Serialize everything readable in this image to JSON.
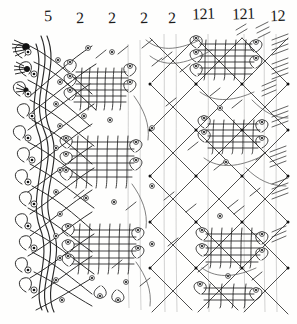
{
  "document": {
    "kind": "hand-drawn-diagram",
    "title": "Bobbin lace working diagram",
    "background_color": "#fefefd",
    "ink_color": "#1f1f1f",
    "faint_ink_color": "#9a9a9a",
    "width": 297,
    "height": 324
  },
  "header": {
    "label": "thread-count-row",
    "sequence": "5 2 2 2 2 121 121 12",
    "marks": [
      {
        "text": "5",
        "x": 44,
        "y": 8,
        "group": 1
      },
      {
        "text": "2",
        "x": 76,
        "y": 10,
        "group": 2
      },
      {
        "text": "2",
        "x": 108,
        "y": 10,
        "group": 3
      },
      {
        "text": "2",
        "x": 140,
        "y": 10,
        "group": 4
      },
      {
        "text": "2",
        "x": 168,
        "y": 10,
        "group": 5
      },
      {
        "text": "121",
        "x": 192,
        "y": 6,
        "group": 6
      },
      {
        "text": "121",
        "x": 232,
        "y": 6,
        "group": 7
      },
      {
        "text": "12",
        "x": 272,
        "y": 8,
        "group": 8
      }
    ]
  },
  "diagram": {
    "regions": [
      {
        "name": "left-footside-edge",
        "note": "double curved wavy vertical threads along left margin"
      },
      {
        "name": "left-dense-loop-field",
        "note": "dense cluster of pin loops with dotted pin heads"
      },
      {
        "name": "central-woven-bands",
        "note": "horizontal woven cloth-stitch bands with side loops"
      },
      {
        "name": "right-diamond-lattice",
        "note": "open diamond ground mesh with dotted crossings"
      },
      {
        "name": "right-tally-blocks",
        "note": "three woven blocks inside the lattice"
      },
      {
        "name": "right-edge-hatch-marks",
        "note": "short parallel hatch clusters along right margin"
      },
      {
        "name": "vertical-guide-lines",
        "note": "faint straight vertical guide lines in right half"
      }
    ],
    "pin_marker": {
      "name": "pin-hole",
      "shape": "small-circle-with-dot"
    }
  }
}
